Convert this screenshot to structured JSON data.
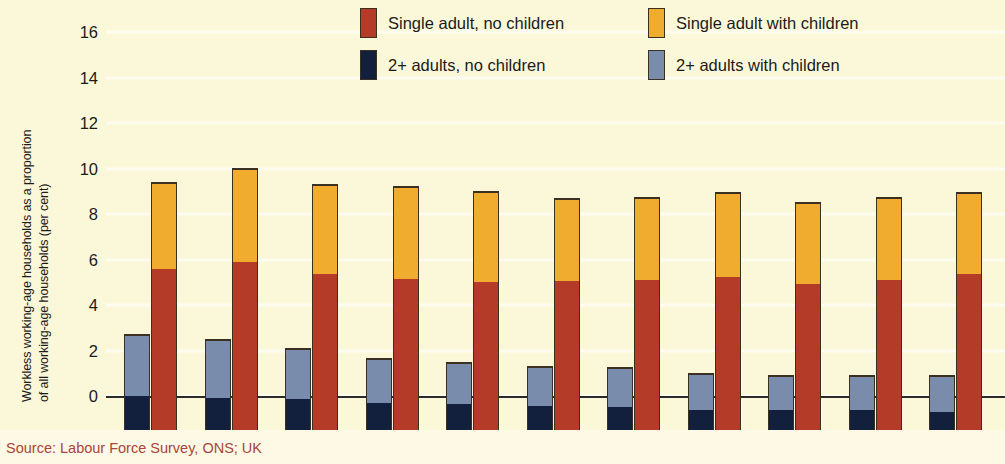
{
  "colors": {
    "background": "#fbf8da",
    "single_no_children": "#b33b28",
    "single_with_children": "#f0ac2e",
    "multi_no_children": "#121f3d",
    "multi_with_children": "#7a8cab",
    "source_text": "#a8453a",
    "axis": "#2a2a2a"
  },
  "axis_title": {
    "line1": "Workless working-age households as a proportion",
    "line2": "of all working-age households (per cent)"
  },
  "legend": [
    {
      "label": "Single adult, no children",
      "color_key": "single_no_children",
      "icon": "legend-swatch-red"
    },
    {
      "label": "Single adult with children",
      "color_key": "single_with_children",
      "icon": "legend-swatch-yellow"
    },
    {
      "label": "2+ adults, no children",
      "color_key": "multi_no_children",
      "icon": "legend-swatch-navy"
    },
    {
      "label": "2+ adults with children",
      "color_key": "multi_with_children",
      "icon": "legend-swatch-bluegrey"
    }
  ],
  "source": "Source: Labour Force Survey, ONS; UK",
  "chart_data": {
    "type": "bar",
    "subtype": "grouped-stacked",
    "title": "",
    "xlabel": "",
    "ylabel": "Workless working-age households as a proportion of all working-age households (per cent)",
    "ylim": [
      0,
      16
    ],
    "yticks": [
      0,
      2,
      4,
      6,
      8,
      10,
      12,
      14,
      16
    ],
    "ytick_labels": [
      "0",
      "2",
      "4",
      "6",
      "8",
      "10",
      "12",
      "14",
      "16"
    ],
    "grid": false,
    "legend_position": "top-right",
    "categories": [
      "1995",
      "1996",
      "1997",
      "1998",
      "1999",
      "2000",
      "2001",
      "2002",
      "2003",
      "2004",
      "2005"
    ],
    "series": [
      {
        "name": "2+ adults, no children",
        "stack": "multi-adult",
        "values": [
          3.0,
          2.9,
          2.85,
          2.7,
          2.65,
          2.55,
          2.5,
          2.4,
          2.4,
          2.4,
          2.3
        ]
      },
      {
        "name": "2+ adults with children",
        "stack": "multi-adult",
        "values": [
          2.7,
          2.6,
          2.25,
          1.95,
          1.85,
          1.75,
          1.75,
          1.6,
          1.5,
          1.5,
          1.6
        ]
      },
      {
        "name": "Single adult, no children",
        "stack": "single-adult",
        "values": [
          8.6,
          8.9,
          8.35,
          8.15,
          8.0,
          8.05,
          8.1,
          8.25,
          7.95,
          8.1,
          8.35
        ]
      },
      {
        "name": "Single adult with children",
        "stack": "single-adult",
        "values": [
          3.8,
          4.1,
          3.95,
          4.05,
          4.0,
          3.65,
          3.65,
          3.7,
          3.55,
          3.65,
          3.6
        ]
      }
    ],
    "stack_totals": {
      "multi-adult": [
        5.7,
        5.5,
        5.1,
        4.65,
        4.5,
        4.3,
        4.25,
        4.0,
        3.9,
        3.9,
        3.9
      ],
      "single-adult": [
        12.4,
        13.0,
        12.3,
        12.2,
        12.0,
        11.7,
        11.75,
        11.95,
        11.5,
        11.75,
        11.95
      ]
    }
  }
}
